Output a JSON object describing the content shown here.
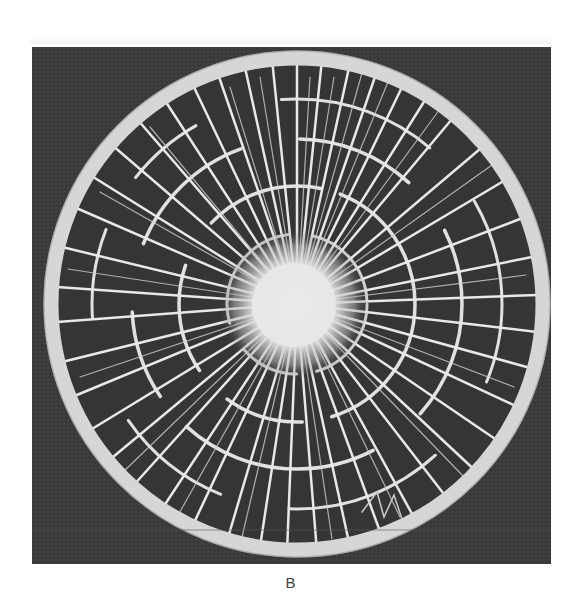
{
  "figure": {
    "caption": "B",
    "colors": {
      "background": "#3a3a3a",
      "ring": "#d8d8d8",
      "crack": "#e6e6e6",
      "impact_center": "#f0f0f0",
      "page": "#ffffff",
      "caption_text": "#444444"
    }
  }
}
